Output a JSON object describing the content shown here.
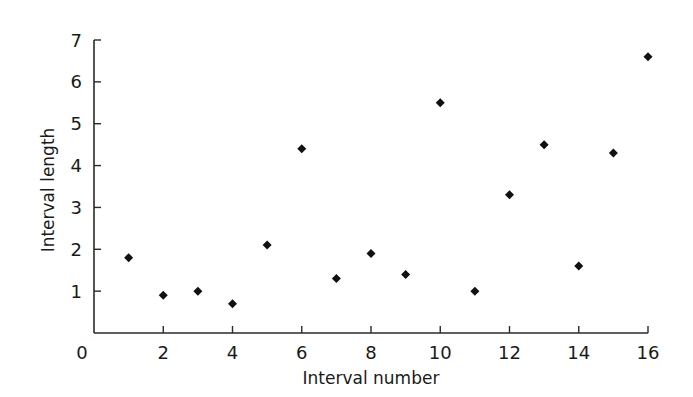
{
  "chart_data": {
    "type": "scatter",
    "title": "",
    "xlabel": "Interval number",
    "ylabel": "Interval length",
    "xlim": [
      0,
      16
    ],
    "ylim": [
      0,
      7
    ],
    "x_ticks": [
      0,
      2,
      4,
      6,
      8,
      10,
      12,
      14,
      16
    ],
    "x_tick_labels": [
      "0",
      "2",
      "4",
      "6",
      "8",
      "10",
      "12",
      "14",
      "16"
    ],
    "y_ticks": [
      1,
      2,
      3,
      4,
      5,
      6,
      7
    ],
    "y_tick_labels": [
      "1",
      "2",
      "3",
      "4",
      "5",
      "6",
      "7"
    ],
    "grid": false,
    "legend": null,
    "marker": "diamond",
    "marker_color": "#111111",
    "series": [
      {
        "name": "Interval length",
        "x": [
          1,
          2,
          3,
          4,
          5,
          6,
          7,
          8,
          9,
          10,
          11,
          12,
          13,
          14,
          15,
          16
        ],
        "y": [
          1.8,
          0.9,
          1.0,
          0.7,
          2.1,
          4.4,
          1.3,
          1.9,
          1.4,
          5.5,
          1.0,
          3.3,
          4.5,
          1.6,
          4.3,
          6.6
        ]
      }
    ]
  }
}
